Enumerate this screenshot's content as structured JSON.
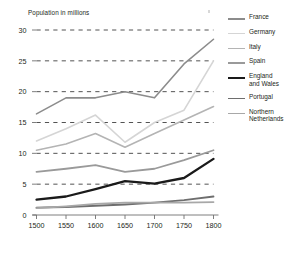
{
  "figure": {
    "axis_title": "Population in millions",
    "background": "#ffffff",
    "text_color": "#231f20",
    "gridline_color": "#3f3f3f",
    "axis_color": "#6f6f6f"
  },
  "legend": {
    "position": "right",
    "entries": [
      {
        "label": "France",
        "color": "#8c8c8c",
        "width": 1.6
      },
      {
        "label": "Germany",
        "color": "#d5d5d5",
        "width": 1.6
      },
      {
        "label": "Italy",
        "color": "#b4b4b4",
        "width": 1.6
      },
      {
        "label": "Spain",
        "color": "#9a9a9a",
        "width": 1.8
      },
      {
        "label": "England\nand Wales",
        "color": "#1a1a1a",
        "width": 2.3
      },
      {
        "label": "Portugal",
        "color": "#6e6e6e",
        "width": 1.8
      },
      {
        "label": "Northern\nNetherlands",
        "color": "#a8a8a8",
        "width": 1.8
      }
    ]
  },
  "chart_data": {
    "type": "line",
    "title": "",
    "subtitle": "",
    "xlabel": "",
    "ylabel": "Population in millions",
    "x": [
      1500,
      1550,
      1600,
      1650,
      1700,
      1750,
      1800
    ],
    "xtick_labels": [
      "1500",
      "1550",
      "1600",
      "1650",
      "1700",
      "1750",
      "1800"
    ],
    "ytick_labels": [
      "0",
      "5",
      "10",
      "15",
      "20",
      "25",
      "30"
    ],
    "yticks": [
      0,
      5,
      10,
      15,
      20,
      25,
      30
    ],
    "xlim": [
      1500,
      1800
    ],
    "ylim": [
      0,
      30
    ],
    "grid": "horizontal-dashed",
    "legend_position": "right",
    "series": [
      {
        "name": "France",
        "color": "#8c8c8c",
        "width": 1.6,
        "values": [
          16.4,
          19.0,
          19.0,
          20.0,
          19.0,
          24.5,
          28.5
        ]
      },
      {
        "name": "Germany",
        "color": "#d5d5d5",
        "width": 1.6,
        "values": [
          12.0,
          14.0,
          16.2,
          11.8,
          15.0,
          17.0,
          25.0
        ]
      },
      {
        "name": "Italy",
        "color": "#b4b4b4",
        "width": 1.6,
        "values": [
          10.5,
          11.5,
          13.2,
          11.0,
          13.2,
          15.4,
          17.6
        ]
      },
      {
        "name": "Spain",
        "color": "#9a9a9a",
        "width": 1.8,
        "values": [
          7.0,
          7.5,
          8.1,
          7.0,
          7.5,
          8.9,
          10.5
        ]
      },
      {
        "name": "England and Wales",
        "color": "#1a1a1a",
        "width": 2.3,
        "values": [
          2.5,
          3.0,
          4.2,
          5.5,
          5.1,
          6.0,
          9.1
        ]
      },
      {
        "name": "Portugal",
        "color": "#6e6e6e",
        "width": 1.8,
        "values": [
          1.2,
          1.3,
          1.5,
          1.7,
          2.0,
          2.4,
          3.0
        ]
      },
      {
        "name": "Northern Netherlands",
        "color": "#a8a8a8",
        "width": 1.8,
        "values": [
          1.1,
          1.4,
          1.8,
          2.0,
          2.0,
          2.0,
          2.1
        ]
      }
    ]
  }
}
